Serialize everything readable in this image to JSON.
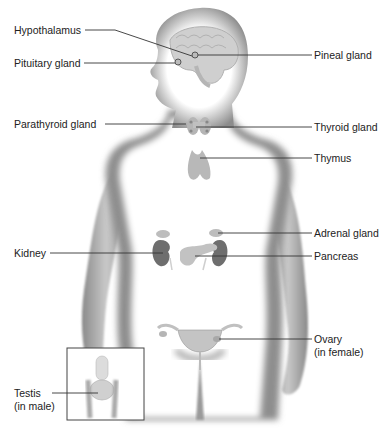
{
  "diagram": {
    "figure_type": "labeled anatomical illustration",
    "colors": {
      "background": "#ffffff",
      "body_edge": "#8a8a8a",
      "organ": "#9a9a9a",
      "kidney": "#6a6a6a",
      "leader_line": "#333333",
      "text": "#222222"
    },
    "labels": {
      "hypothalamus": "Hypothalamus",
      "pituitary": "Pituitary gland",
      "pineal": "Pineal gland",
      "parathyroid": "Parathyroid gland",
      "thyroid": "Thyroid gland",
      "thymus": "Thymus",
      "adrenal": "Adrenal gland",
      "kidney": "Kidney",
      "pancreas": "Pancreas",
      "ovary_line1": "Ovary",
      "ovary_line2": "(in female)",
      "testis_line1": "Testis",
      "testis_line2": "(in male)"
    }
  }
}
